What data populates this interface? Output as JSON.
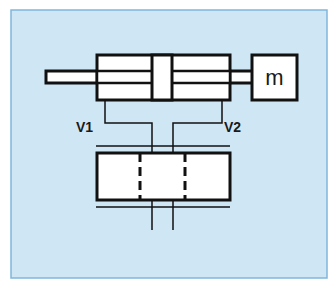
{
  "diagram": {
    "type": "hydraulic-cylinder-schematic",
    "colors": {
      "background": "#cfe6f5",
      "frame_border": "#7fb6dc",
      "stroke": "#111111",
      "fill": "#ffffff"
    },
    "mass": {
      "label": "m"
    },
    "ports": [
      {
        "id": "port-1",
        "label": "V1"
      },
      {
        "id": "port-2",
        "label": "V2"
      }
    ],
    "components": [
      "cylinder",
      "piston",
      "piston-rod",
      "mass",
      "valve"
    ]
  }
}
